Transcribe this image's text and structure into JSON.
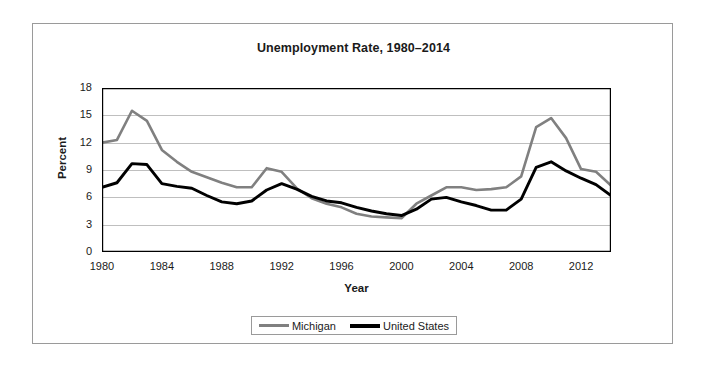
{
  "chart_data": {
    "type": "line",
    "title": "Unemployment Rate, 1980–2014",
    "xlabel": "Year",
    "ylabel": "Percent",
    "ylim": [
      0,
      18
    ],
    "xlim": [
      1980,
      2014
    ],
    "yticks": [
      0,
      3,
      6,
      9,
      12,
      15,
      18
    ],
    "xticks": [
      1980,
      1984,
      1988,
      1992,
      1996,
      2000,
      2004,
      2008,
      2012
    ],
    "xtick_step_minor": 1,
    "grid": "horizontal",
    "legend_position": "bottom-center",
    "x": [
      1980,
      1981,
      1982,
      1983,
      1984,
      1985,
      1986,
      1987,
      1988,
      1989,
      1990,
      1991,
      1992,
      1993,
      1994,
      1995,
      1996,
      1997,
      1998,
      1999,
      2000,
      2001,
      2002,
      2003,
      2004,
      2005,
      2006,
      2007,
      2008,
      2009,
      2010,
      2011,
      2012,
      2013,
      2014
    ],
    "series": [
      {
        "name": "Michigan",
        "color": "#808080",
        "values": [
          12.0,
          12.3,
          15.5,
          14.4,
          11.2,
          9.9,
          8.8,
          8.2,
          7.6,
          7.1,
          7.1,
          9.2,
          8.8,
          7.0,
          5.9,
          5.3,
          4.9,
          4.2,
          3.9,
          3.8,
          3.7,
          5.3,
          6.2,
          7.1,
          7.1,
          6.8,
          6.9,
          7.1,
          8.3,
          13.7,
          14.7,
          12.5,
          9.1,
          8.8,
          7.3
        ]
      },
      {
        "name": "United States",
        "color": "#000000",
        "values": [
          7.1,
          7.6,
          9.7,
          9.6,
          7.5,
          7.2,
          7.0,
          6.2,
          5.5,
          5.3,
          5.6,
          6.8,
          7.5,
          6.9,
          6.1,
          5.6,
          5.4,
          4.9,
          4.5,
          4.2,
          4.0,
          4.7,
          5.8,
          6.0,
          5.5,
          5.1,
          4.6,
          4.6,
          5.8,
          9.3,
          9.9,
          8.9,
          8.1,
          7.4,
          6.2
        ]
      }
    ]
  },
  "legend": {
    "entries": [
      {
        "label": "Michigan"
      },
      {
        "label": "United States"
      }
    ]
  },
  "colors": {
    "michigan": "#808080",
    "united_states": "#000000",
    "grid": "#bfbfbf",
    "axis": "#000000",
    "frame": "#9a9a9a"
  }
}
